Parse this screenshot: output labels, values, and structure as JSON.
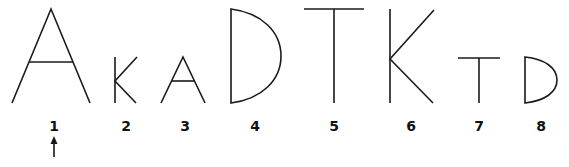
{
  "figure": {
    "stroke_color": "#1a1a1a",
    "background": "#ffffff",
    "items": [
      {
        "index": "1",
        "glyph": "A",
        "size": "large",
        "label_x": 54
      },
      {
        "index": "2",
        "glyph": "K",
        "size": "small",
        "label_x": 126
      },
      {
        "index": "3",
        "glyph": "A",
        "size": "small",
        "label_x": 185
      },
      {
        "index": "4",
        "glyph": "D",
        "size": "large",
        "label_x": 255
      },
      {
        "index": "5",
        "glyph": "T",
        "size": "large",
        "label_x": 334
      },
      {
        "index": "6",
        "glyph": "K",
        "size": "large",
        "label_x": 411
      },
      {
        "index": "7",
        "glyph": "T",
        "size": "small",
        "label_x": 479
      },
      {
        "index": "8",
        "glyph": "D",
        "size": "small",
        "label_x": 541
      }
    ],
    "pointer": {
      "target_index": "1",
      "direction": "up",
      "icon": "arrow-up-icon"
    }
  }
}
